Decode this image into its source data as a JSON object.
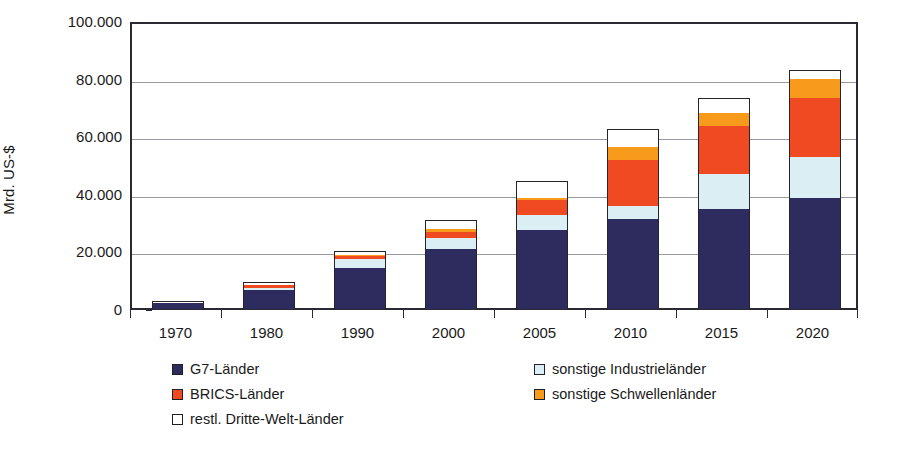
{
  "chart_data": {
    "type": "bar",
    "subtype": "stacked-bar",
    "title": "",
    "xlabel": "",
    "ylabel": "Mrd. US-$",
    "ylim": [
      0,
      100000
    ],
    "yticks": [
      0,
      20000,
      40000,
      60000,
      80000,
      100000
    ],
    "ytick_labels": [
      "0",
      "20.000",
      "40.000",
      "60.000",
      "80.000",
      "100.000"
    ],
    "grid": true,
    "grid_axis": "y",
    "legend_position": "below",
    "categories": [
      "1970",
      "1980",
      "1990",
      "2000",
      "2005",
      "2010",
      "2015",
      "2020"
    ],
    "series": [
      {
        "name": "G7-Länder",
        "color": "#2e2b5f",
        "values": [
          2600,
          7100,
          14800,
          21500,
          27900,
          32000,
          35400,
          39100
        ]
      },
      {
        "name": "sonstige Industrieländer",
        "color": "#daeef3",
        "values": [
          250,
          1400,
          3600,
          4100,
          6000,
          5000,
          12600,
          14900
        ]
      },
      {
        "name": "BRICS-Länder",
        "color": "#f04a23",
        "values": [
          200,
          1300,
          1700,
          2600,
          5600,
          16500,
          17000,
          21000
        ]
      },
      {
        "name": "sonstige Schwellenländer",
        "color": "#f89b1c",
        "values": [
          100,
          500,
          900,
          1700,
          1200,
          5000,
          5000,
          7000
        ]
      },
      {
        "name": "restl. Dritte-Welt-Länder",
        "color": "#ffffff",
        "values": [
          100,
          1200,
          1300,
          3100,
          5800,
          6000,
          5500,
          3000
        ]
      }
    ],
    "totals": [
      3250,
      11500,
      22300,
      33000,
      46500,
      64500,
      75500,
      85000
    ]
  },
  "axis": {
    "ylabel": "Mrd. US-$",
    "yticks": [
      "100.000",
      "80.000",
      "60.000",
      "40.000",
      "20.000",
      "0"
    ],
    "xlabels": [
      "1970",
      "1980",
      "1990",
      "2000",
      "2005",
      "2010",
      "2015",
      "2020"
    ]
  },
  "legend": {
    "items": [
      {
        "label": "G7-Länder",
        "color": "#2e2b5f"
      },
      {
        "label": "BRICS-Länder",
        "color": "#f04a23"
      },
      {
        "label": "restl. Dritte-Welt-Länder",
        "color": "#ffffff"
      },
      {
        "label": "sonstige Industrieländer",
        "color": "#daeef3"
      },
      {
        "label": "sonstige Schwellenländer",
        "color": "#f89b1c"
      }
    ]
  },
  "colors": {
    "g7": "#2e2b5f",
    "other_industrial": "#daeef3",
    "brics": "#f04a23",
    "other_emerging": "#f89b1c",
    "third_world": "#ffffff",
    "axis": "#2a2a33",
    "grid": "#9a9aa2"
  }
}
